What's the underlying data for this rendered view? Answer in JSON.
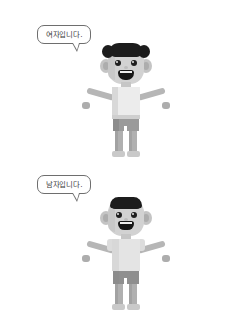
{
  "canvas": {
    "width": 251,
    "height": 332,
    "background": "#ffffff"
  },
  "panels": [
    {
      "id": "female",
      "speech": {
        "text": "여자입니다.",
        "border_color": "#6e6e6e",
        "text_color": "#3a3a3a",
        "background": "#ffffff"
      },
      "character": {
        "name": "female-figure",
        "hair_style": "long-with-side-puffs",
        "hair_color": "#1c1c1c",
        "skin_color": "#d2d2d2",
        "top": "sleeveless-tank-top",
        "top_color": "#ececec",
        "shorts_color": "#9a9a9a",
        "leg_color": "#b0b0b0"
      }
    },
    {
      "id": "male",
      "speech": {
        "text": "남자입니다.",
        "border_color": "#6e6e6e",
        "text_color": "#3a3a3a",
        "background": "#ffffff"
      },
      "character": {
        "name": "male-figure",
        "hair_style": "short-flat",
        "hair_color": "#1c1c1c",
        "skin_color": "#d2d2d2",
        "top": "short-sleeve-shirt",
        "top_color": "#e4e4e4",
        "shorts_color": "#8f8f8f",
        "leg_color": "#b0b0b0"
      }
    }
  ]
}
